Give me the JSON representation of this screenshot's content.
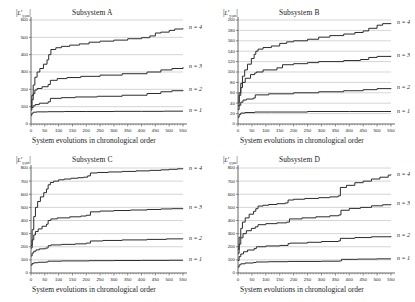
{
  "figure": {
    "ylabel_main": "L",
    "ylabel_sup": "r",
    "ylabel_sub": "γ;ρn",
    "xcaption": "System evolutions in chronological order",
    "series_labels": [
      "n = 1",
      "n = 2",
      "n = 3",
      "n = 4"
    ],
    "grid_color": "#b8b8b8",
    "axis_color": "#555555",
    "curve_color": "#2b2b2b"
  },
  "chart_data": [
    {
      "type": "line",
      "title": "Subsystem A",
      "xlabel": "System evolutions in chronological order",
      "ylabel": "|L^r_{γ;ρn}|",
      "xlim": [
        0,
        550
      ],
      "ylim": [
        0,
        600
      ],
      "xticks": [
        0,
        50,
        100,
        150,
        200,
        250,
        300,
        350,
        400,
        450,
        500,
        550
      ],
      "yticks": [
        0,
        100,
        200,
        300,
        400,
        500,
        600
      ],
      "grid": true,
      "legend_position": "right-inline",
      "series": [
        {
          "name": "n = 1",
          "x": [
            0,
            3,
            8,
            20,
            60,
            120,
            200,
            300,
            400,
            480,
            550
          ],
          "values": [
            50,
            62,
            68,
            70,
            71,
            72,
            72,
            73,
            73,
            74,
            74
          ]
        },
        {
          "name": "n = 2",
          "x": [
            0,
            3,
            8,
            15,
            30,
            62,
            70,
            110,
            160,
            240,
            330,
            420,
            470,
            510,
            550
          ],
          "values": [
            80,
            95,
            105,
            112,
            120,
            128,
            148,
            152,
            156,
            160,
            166,
            176,
            186,
            192,
            196
          ]
        },
        {
          "name": "n = 3",
          "x": [
            0,
            3,
            8,
            14,
            22,
            40,
            62,
            70,
            95,
            130,
            180,
            250,
            330,
            420,
            470,
            510,
            550
          ],
          "values": [
            95,
            140,
            175,
            196,
            205,
            215,
            228,
            252,
            262,
            268,
            275,
            282,
            290,
            300,
            312,
            320,
            328
          ]
        },
        {
          "name": "n = 4",
          "x": [
            0,
            3,
            8,
            14,
            22,
            32,
            45,
            58,
            64,
            72,
            90,
            110,
            140,
            175,
            210,
            250,
            300,
            350,
            400,
            430,
            450,
            470,
            500,
            520,
            550
          ],
          "values": [
            100,
            165,
            225,
            270,
            300,
            320,
            345,
            370,
            400,
            430,
            440,
            448,
            455,
            462,
            472,
            478,
            484,
            492,
            498,
            508,
            525,
            530,
            540,
            548,
            552
          ]
        }
      ]
    },
    {
      "type": "line",
      "title": "Subsystem B",
      "xlabel": "System evolutions in chronological order",
      "ylabel": "|L^r_{γ;ρn}|",
      "xlim": [
        0,
        550
      ],
      "ylim": [
        0,
        200
      ],
      "xticks": [
        0,
        50,
        100,
        150,
        200,
        250,
        300,
        350,
        400,
        450,
        500,
        550
      ],
      "yticks": [
        0,
        20,
        40,
        60,
        80,
        100,
        120,
        140,
        160,
        180,
        200
      ],
      "grid": true,
      "legend_position": "right-inline",
      "series": [
        {
          "name": "n = 1",
          "x": [
            0,
            4,
            10,
            25,
            60,
            120,
            250,
            400,
            550
          ],
          "values": [
            13,
            18,
            21,
            22,
            23,
            23,
            24,
            24,
            24
          ]
        },
        {
          "name": "n = 2",
          "x": [
            0,
            4,
            10,
            18,
            30,
            55,
            62,
            110,
            200,
            290,
            380,
            450,
            500,
            550
          ],
          "values": [
            28,
            36,
            42,
            46,
            48,
            50,
            56,
            58,
            60,
            62,
            64,
            66,
            68,
            69
          ]
        },
        {
          "name": "n = 3",
          "x": [
            0,
            4,
            10,
            16,
            26,
            45,
            60,
            66,
            90,
            140,
            160,
            200,
            250,
            290,
            380,
            440,
            470,
            500,
            550
          ],
          "values": [
            35,
            55,
            70,
            80,
            88,
            95,
            98,
            100,
            104,
            108,
            114,
            116,
            118,
            120,
            122,
            124,
            128,
            130,
            131
          ]
        },
        {
          "name": "n = 4",
          "x": [
            0,
            4,
            10,
            16,
            24,
            34,
            48,
            58,
            64,
            72,
            90,
            120,
            150,
            175,
            200,
            250,
            290,
            330,
            380,
            420,
            450,
            470,
            500,
            520,
            550
          ],
          "values": [
            42,
            60,
            78,
            92,
            104,
            115,
            126,
            134,
            140,
            144,
            147,
            150,
            155,
            158,
            160,
            163,
            167,
            170,
            173,
            176,
            179,
            184,
            190,
            193,
            194
          ]
        }
      ]
    },
    {
      "type": "line",
      "title": "Subsystem C",
      "xlabel": "System evolutions in chronological order",
      "ylabel": "|L^r_{γ;ρn}|",
      "xlim": [
        0,
        550
      ],
      "ylim": [
        0,
        800
      ],
      "xticks": [
        0,
        50,
        100,
        150,
        200,
        250,
        300,
        350,
        400,
        450,
        500,
        550
      ],
      "yticks": [
        0,
        100,
        200,
        300,
        400,
        500,
        600,
        700,
        800
      ],
      "grid": true,
      "legend_position": "right-inline",
      "series": [
        {
          "name": "n = 1",
          "x": [
            0,
            4,
            10,
            25,
            55,
            62,
            110,
            210,
            300,
            400,
            500,
            550
          ],
          "values": [
            60,
            72,
            78,
            82,
            84,
            90,
            92,
            94,
            95,
            96,
            97,
            97
          ]
        },
        {
          "name": "n = 2",
          "x": [
            0,
            4,
            10,
            18,
            30,
            52,
            62,
            72,
            110,
            160,
            200,
            215,
            260,
            330,
            420,
            490,
            550
          ],
          "values": [
            130,
            152,
            166,
            176,
            184,
            190,
            208,
            214,
            218,
            222,
            228,
            244,
            248,
            252,
            256,
            260,
            262
          ]
        },
        {
          "name": "n = 3",
          "x": [
            0,
            4,
            10,
            16,
            26,
            40,
            56,
            62,
            72,
            95,
            140,
            180,
            200,
            215,
            250,
            300,
            360,
            420,
            470,
            510,
            550
          ],
          "values": [
            190,
            252,
            290,
            316,
            336,
            356,
            372,
            400,
            412,
            420,
            428,
            434,
            440,
            466,
            472,
            476,
            480,
            484,
            488,
            490,
            492
          ]
        },
        {
          "name": "n = 4",
          "x": [
            0,
            4,
            10,
            16,
            24,
            34,
            46,
            56,
            62,
            70,
            82,
            100,
            120,
            145,
            170,
            190,
            205,
            215,
            240,
            280,
            330,
            380,
            430,
            470,
            500,
            530,
            550
          ],
          "values": [
            210,
            330,
            430,
            500,
            545,
            580,
            612,
            640,
            672,
            690,
            700,
            710,
            716,
            722,
            726,
            730,
            740,
            762,
            766,
            770,
            774,
            778,
            782,
            786,
            790,
            794,
            796
          ]
        }
      ]
    },
    {
      "type": "line",
      "title": "Subsystem D",
      "xlabel": "System evolutions in chronological order",
      "ylabel": "|L^r_{γ;ρn}|",
      "xlim": [
        0,
        550
      ],
      "ylim": [
        0,
        800
      ],
      "xticks": [
        0,
        50,
        100,
        150,
        200,
        250,
        300,
        350,
        400,
        450,
        500,
        550
      ],
      "yticks": [
        0,
        100,
        200,
        300,
        400,
        500,
        600,
        700,
        800
      ],
      "grid": true,
      "legend_position": "right-inline",
      "series": [
        {
          "name": "n = 1",
          "x": [
            0,
            4,
            10,
            25,
            55,
            65,
            110,
            180,
            300,
            365,
            372,
            430,
            500,
            550
          ],
          "values": [
            45,
            62,
            70,
            76,
            80,
            84,
            86,
            88,
            90,
            92,
            104,
            106,
            108,
            108
          ]
        },
        {
          "name": "n = 2",
          "x": [
            0,
            4,
            10,
            20,
            34,
            58,
            66,
            100,
            150,
            180,
            188,
            250,
            300,
            360,
            368,
            420,
            480,
            550
          ],
          "values": [
            95,
            125,
            145,
            162,
            175,
            186,
            200,
            206,
            210,
            224,
            228,
            234,
            240,
            244,
            264,
            270,
            276,
            282
          ]
        },
        {
          "name": "n = 3",
          "x": [
            0,
            4,
            10,
            18,
            30,
            48,
            62,
            72,
            100,
            140,
            175,
            185,
            230,
            280,
            330,
            362,
            370,
            400,
            440,
            480,
            520,
            550
          ],
          "values": [
            150,
            220,
            268,
            300,
            322,
            340,
            352,
            368,
            376,
            382,
            388,
            412,
            420,
            428,
            436,
            442,
            478,
            492,
            500,
            512,
            520,
            524
          ]
        },
        {
          "name": "n = 4",
          "x": [
            0,
            4,
            10,
            16,
            26,
            40,
            56,
            64,
            72,
            90,
            110,
            140,
            170,
            180,
            200,
            240,
            290,
            330,
            360,
            368,
            390,
            420,
            450,
            480,
            510,
            540,
            550
          ],
          "values": [
            180,
            272,
            340,
            388,
            420,
            448,
            470,
            490,
            510,
            516,
            522,
            528,
            534,
            556,
            562,
            568,
            574,
            580,
            588,
            652,
            668,
            688,
            700,
            716,
            730,
            746,
            750
          ]
        }
      ]
    }
  ]
}
